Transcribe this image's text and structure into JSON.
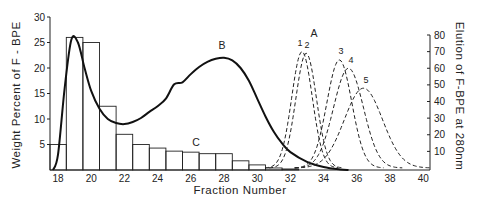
{
  "chart_data": {
    "type": "bar+line",
    "title": "",
    "xlabel": "Fraction Number",
    "ylabel_left": "Weight Percent of F-BPE",
    "ylabel_right": "Elution of F-BPE at 280nm",
    "x_ticks": [
      18,
      20,
      22,
      24,
      26,
      28,
      30,
      32,
      34,
      36,
      38,
      40
    ],
    "xlim": [
      17.5,
      40.5
    ],
    "ylim_left": [
      0,
      30
    ],
    "y_ticks_left": [
      5,
      10,
      15,
      20,
      25,
      30
    ],
    "ylim_right": [
      0,
      80
    ],
    "y_ticks_right": [
      10,
      20,
      30,
      40,
      50,
      60,
      70,
      80
    ],
    "grid": false,
    "histogram_C": {
      "label": "C",
      "axis": "left",
      "fractions": [
        18,
        19,
        20,
        21,
        22,
        23,
        24,
        25,
        26,
        27,
        28,
        29,
        30,
        31,
        32
      ],
      "values": [
        5,
        26,
        25,
        12.5,
        7,
        5,
        4.3,
        3.7,
        3.5,
        3.2,
        3.2,
        1.8,
        1.0,
        0.4,
        0.2
      ]
    },
    "curve_B": {
      "label": "B",
      "axis": "left",
      "style": "solid",
      "x": [
        17.7,
        18.0,
        18.4,
        18.8,
        19.2,
        19.6,
        20.0,
        20.5,
        21.0,
        21.5,
        22.0,
        22.5,
        23.0,
        23.5,
        24.0,
        24.5,
        25.0,
        25.5,
        26.0,
        26.5,
        27.0,
        27.5,
        28.0,
        28.5,
        29.0,
        29.5,
        30.0,
        30.5,
        31.0,
        31.5,
        32.0,
        33.0,
        34.0,
        35.0,
        35.5
      ],
      "y": [
        0,
        3,
        16,
        25.5,
        25,
        20,
        15.5,
        12,
        10,
        9.2,
        9,
        9.4,
        10.2,
        11.4,
        12.5,
        14,
        16.8,
        17.2,
        18.8,
        20.2,
        21.2,
        21.8,
        22,
        21.5,
        20,
        17.5,
        14,
        10.5,
        7.5,
        5.2,
        3.5,
        1.6,
        0.6,
        0.1,
        0
      ]
    },
    "curves_A": {
      "label": "A",
      "axis": "right",
      "style": "dashed",
      "series": [
        {
          "name": "1",
          "peak_x": 32.7,
          "peak_y": 70,
          "sigma": 0.62
        },
        {
          "name": "2",
          "peak_x": 32.95,
          "peak_y": 69,
          "sigma": 0.62
        },
        {
          "name": "3",
          "peak_x": 34.95,
          "peak_y": 65,
          "sigma": 0.75
        },
        {
          "name": "4",
          "peak_x": 35.5,
          "peak_y": 60,
          "sigma": 0.9
        },
        {
          "name": "5",
          "peak_x": 36.4,
          "peak_y": 48,
          "sigma": 1.15
        }
      ]
    },
    "annotations": [
      "A",
      "B",
      "C",
      "1",
      "2",
      "3",
      "4",
      "5"
    ]
  }
}
